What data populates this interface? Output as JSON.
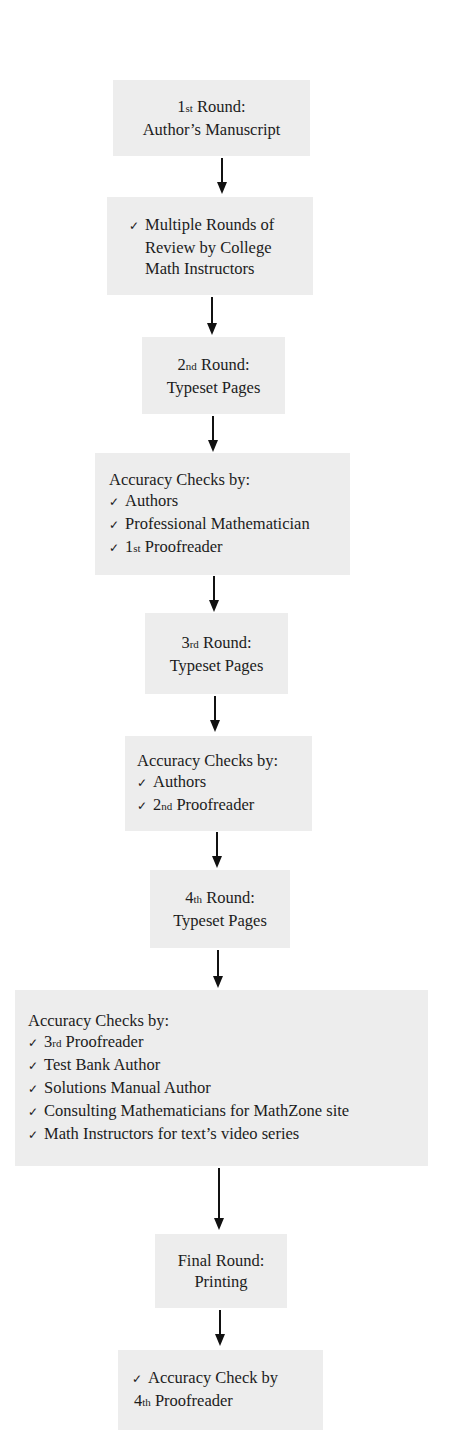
{
  "diagram": {
    "type": "flowchart",
    "direction": "top-to-bottom",
    "colors": {
      "box_background": "#ededed",
      "text": "#1c1c1c",
      "arrow": "#111111",
      "page_background": "#ffffff"
    },
    "check_glyph": "✓",
    "steps": [
      {
        "id": "round1",
        "lines": [
          {
            "ord_num": "1",
            "ord_suffix": "st",
            "text": " Round:"
          },
          {
            "text": "Author’s Manuscript"
          }
        ]
      },
      {
        "id": "review",
        "lines": [
          {
            "check": true,
            "text": "Multiple Rounds of"
          },
          {
            "text": "Review by College"
          },
          {
            "text": "Math Instructors"
          }
        ]
      },
      {
        "id": "round2",
        "lines": [
          {
            "ord_num": "2",
            "ord_suffix": "nd",
            "text": " Round:"
          },
          {
            "text": "Typeset Pages"
          }
        ]
      },
      {
        "id": "checks1",
        "heading": "Accuracy Checks by:",
        "items": [
          {
            "text": "Authors"
          },
          {
            "text": "Professional Mathematician"
          },
          {
            "ord_num": "1",
            "ord_suffix": "st",
            "text": " Proofreader"
          }
        ]
      },
      {
        "id": "round3",
        "lines": [
          {
            "ord_num": "3",
            "ord_suffix": "rd",
            "text": " Round:"
          },
          {
            "text": "Typeset Pages"
          }
        ]
      },
      {
        "id": "checks2",
        "heading": "Accuracy Checks by:",
        "items": [
          {
            "text": "Authors"
          },
          {
            "ord_num": "2",
            "ord_suffix": "nd",
            "text": " Proofreader"
          }
        ]
      },
      {
        "id": "round4",
        "lines": [
          {
            "ord_num": "4",
            "ord_suffix": "th",
            "text": " Round:"
          },
          {
            "text": "Typeset Pages"
          }
        ]
      },
      {
        "id": "checks3",
        "heading": "Accuracy Checks by:",
        "items": [
          {
            "ord_num": "3",
            "ord_suffix": "rd",
            "text": " Proofreader"
          },
          {
            "text": "Test Bank Author"
          },
          {
            "text": "Solutions Manual Author"
          },
          {
            "text": "Consulting Mathematicians for MathZone site"
          },
          {
            "text": "Math Instructors for text’s video series"
          }
        ]
      },
      {
        "id": "final",
        "lines": [
          {
            "text": "Final Round:"
          },
          {
            "text": "Printing"
          }
        ]
      },
      {
        "id": "final_check",
        "lines": [
          {
            "check": true,
            "text": "Accuracy Check by"
          },
          {
            "ord_num": "4",
            "ord_suffix": "th",
            "text": " Proofreader"
          }
        ]
      }
    ]
  }
}
